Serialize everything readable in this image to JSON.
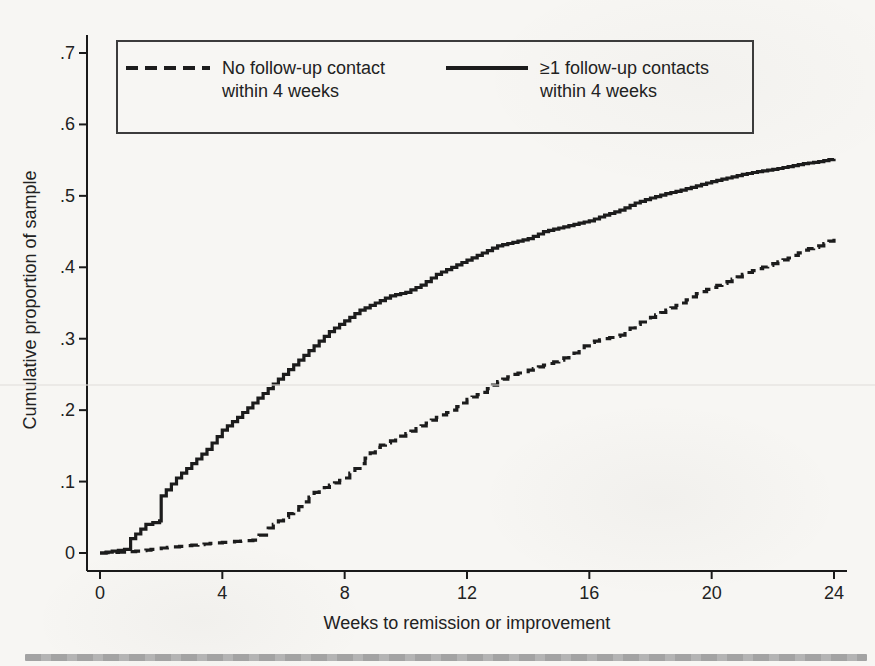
{
  "page": {
    "paper_color": "#f7f6f3",
    "rule_color": "#a8a8a8"
  },
  "chart_data": {
    "type": "line",
    "subtype": "cumulative-step-survival",
    "title": "",
    "xlabel": "Weeks to remission or improvement",
    "ylabel": "Cumulative proportion of sample",
    "xlim": [
      0,
      24
    ],
    "ylim": [
      0,
      0.7
    ],
    "grid": false,
    "legend_position": "top-inside-box",
    "line_color": "#1c1c1c",
    "axis_color": "#1a1a1a",
    "x_ticks": [
      0,
      4,
      8,
      12,
      16,
      20,
      24
    ],
    "y_ticks": {
      "values": [
        0.7,
        0.6,
        0.5,
        0.4,
        0.3,
        0.2,
        0.1,
        0
      ],
      "labels": [
        ".7",
        ".6",
        ".5",
        ".4",
        ".3",
        ".2",
        ".1",
        "0"
      ]
    },
    "series": [
      {
        "name": "No follow-up contact within 4 weeks",
        "style": "dashed",
        "x": [
          0,
          1,
          1.5,
          2,
          3,
          4,
          5,
          5.2,
          5.5,
          6,
          6.5,
          7,
          7.5,
          8,
          8.5,
          9,
          9.5,
          10,
          10.5,
          11,
          11.5,
          12,
          12.5,
          13,
          13.5,
          14,
          14.5,
          15,
          15.5,
          16,
          16.5,
          17,
          17.5,
          18,
          18.5,
          19,
          19.5,
          20,
          20.5,
          21,
          21.5,
          22,
          22.5,
          23,
          23.5,
          24
        ],
        "y": [
          0,
          0.002,
          0.004,
          0.007,
          0.011,
          0.015,
          0.018,
          0.025,
          0.035,
          0.05,
          0.065,
          0.085,
          0.095,
          0.105,
          0.125,
          0.148,
          0.157,
          0.167,
          0.178,
          0.19,
          0.2,
          0.215,
          0.225,
          0.24,
          0.25,
          0.256,
          0.263,
          0.27,
          0.28,
          0.295,
          0.3,
          0.305,
          0.32,
          0.33,
          0.34,
          0.35,
          0.363,
          0.372,
          0.38,
          0.39,
          0.398,
          0.405,
          0.413,
          0.424,
          0.43,
          0.44
        ]
      },
      {
        "name": "≥1 follow-up contacts within 4 weeks",
        "style": "solid",
        "x": [
          0,
          0.8,
          1,
          1.5,
          1.95,
          2,
          2.5,
          3,
          3.5,
          4,
          4.5,
          5,
          5.5,
          6,
          6.5,
          7,
          7.5,
          8,
          8.5,
          9,
          9.5,
          10,
          10.5,
          11,
          11.5,
          12,
          12.5,
          13,
          13.5,
          14,
          14.5,
          15,
          15.5,
          16,
          16.5,
          17,
          17.5,
          18,
          18.5,
          19,
          19.5,
          20,
          20.5,
          21,
          21.5,
          22,
          22.5,
          23,
          23.5,
          24
        ],
        "y": [
          0,
          0.005,
          0.02,
          0.04,
          0.045,
          0.08,
          0.105,
          0.125,
          0.145,
          0.172,
          0.19,
          0.21,
          0.23,
          0.25,
          0.27,
          0.29,
          0.31,
          0.325,
          0.34,
          0.35,
          0.36,
          0.365,
          0.375,
          0.39,
          0.4,
          0.41,
          0.42,
          0.43,
          0.435,
          0.44,
          0.45,
          0.455,
          0.46,
          0.465,
          0.473,
          0.48,
          0.49,
          0.497,
          0.503,
          0.508,
          0.514,
          0.52,
          0.525,
          0.53,
          0.534,
          0.537,
          0.541,
          0.545,
          0.548,
          0.552
        ]
      }
    ]
  }
}
